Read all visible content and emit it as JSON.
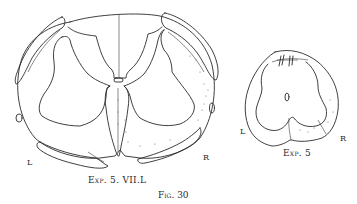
{
  "figure": {
    "number_label": "Fig. 30",
    "panels": [
      {
        "id": "left-section",
        "caption": "Exp. 5.   VII.L",
        "side_left": "L",
        "side_right": "R"
      },
      {
        "id": "right-section",
        "caption": "Exp. 5",
        "side_left": "L",
        "side_right": "R"
      }
    ]
  },
  "colors": {
    "ink": "#2a2a2a",
    "paper": "#ffffff",
    "stipple": "#555555"
  }
}
